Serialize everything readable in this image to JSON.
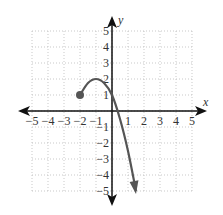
{
  "chart_data": {
    "type": "line",
    "title": "",
    "xlabel": "x",
    "ylabel": "y",
    "xlim": [
      -5,
      5
    ],
    "ylim": [
      -5,
      5
    ],
    "grid": true,
    "x_ticks": [
      "-5",
      "-4",
      "-3",
      "-2",
      "-1",
      "1",
      "2",
      "3",
      "4",
      "5"
    ],
    "y_ticks": [
      "5",
      "4",
      "3",
      "2",
      "1",
      "-1",
      "-2",
      "-3",
      "-4",
      "-5"
    ],
    "series": [
      {
        "name": "f(x)",
        "start_point": {
          "x": -2,
          "y": 1,
          "closed": true
        },
        "end": "arrow",
        "points": [
          {
            "x": -2,
            "y": 1
          },
          {
            "x": -1.5,
            "y": 1.75
          },
          {
            "x": -1,
            "y": 2
          },
          {
            "x": -0.5,
            "y": 1.75
          },
          {
            "x": 0,
            "y": 1
          },
          {
            "x": 0.5,
            "y": -0.5
          },
          {
            "x": 1,
            "y": -2.5
          },
          {
            "x": 1.5,
            "y": -5
          }
        ]
      }
    ],
    "colors": {
      "curve": "#555555",
      "axes": "#111111",
      "grid": "#bbbbbb"
    }
  }
}
